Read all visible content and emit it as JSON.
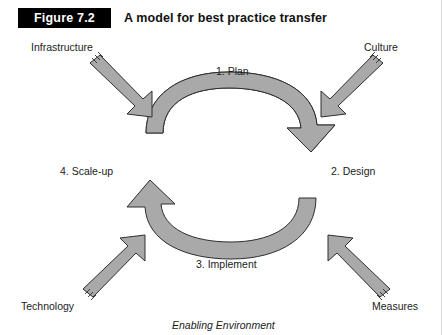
{
  "figure": {
    "badge": "Figure 7.2",
    "title": "A model for best practice transfer",
    "caption": "Enabling Environment"
  },
  "cycle": {
    "steps": [
      {
        "id": "plan",
        "label": "1. Plan"
      },
      {
        "id": "design",
        "label": "2. Design"
      },
      {
        "id": "implement",
        "label": "3. Implement"
      },
      {
        "id": "scaleup",
        "label": "4. Scale-up"
      }
    ]
  },
  "enablers": [
    {
      "id": "infrastructure",
      "label": "Infrastructure",
      "direction": "down-right"
    },
    {
      "id": "culture",
      "label": "Culture",
      "direction": "down-left"
    },
    {
      "id": "technology",
      "label": "Technology",
      "direction": "up-right"
    },
    {
      "id": "measures",
      "label": "Measures",
      "direction": "up-left"
    }
  ],
  "colors": {
    "shape_fill": "#a9a9a9",
    "shape_stroke": "#2e2e2e",
    "badge_background": "#000000",
    "badge_text": "#ffffff",
    "text": "#1b1b1b",
    "page_background": "#ffffff"
  }
}
